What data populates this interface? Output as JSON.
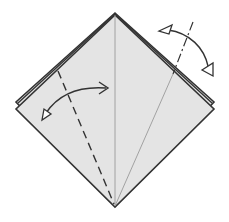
{
  "diagram": {
    "type": "origami-fold-diagram",
    "paper_fill": "#e4e4e4",
    "line_color": "#333333",
    "crease_color": "#8a8a8a",
    "elements": {
      "paper": "square-base diamond with layered top flaps",
      "center_crease": "vertical valley crease from top to bottom vertex",
      "right_crease": "thin crease from bottom vertex to upper-right edge",
      "left_fold_line": "dashed valley fold line on left flap",
      "right_fold_line": "dash-dot mountain fold line on right flap",
      "left_arrow": "fold-and-unfold arrow over left flap",
      "right_arrow": "fold-behind-and-unfold arrow over right flap"
    }
  }
}
